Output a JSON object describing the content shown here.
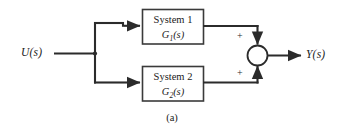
{
  "figure": {
    "caption": "(a)",
    "type": "block-diagram"
  },
  "signals": {
    "input_label": "U(s)",
    "output_label": "Y(s)"
  },
  "blocks": [
    {
      "id": "system-1",
      "title": "System 1",
      "transfer_prefix": "G",
      "transfer_subscript": "1",
      "transfer_suffix": "(s)"
    },
    {
      "id": "system-2",
      "title": "System 2",
      "transfer_prefix": "G",
      "transfer_subscript": "2",
      "transfer_suffix": "(s)"
    }
  ],
  "summing_junction": {
    "top_sign": "+",
    "bottom_sign": "+"
  },
  "colors": {
    "line": "#2b2b2b",
    "block_border": "#3a3a3a",
    "text": "#1b1b1b",
    "background": "#ffffff"
  }
}
